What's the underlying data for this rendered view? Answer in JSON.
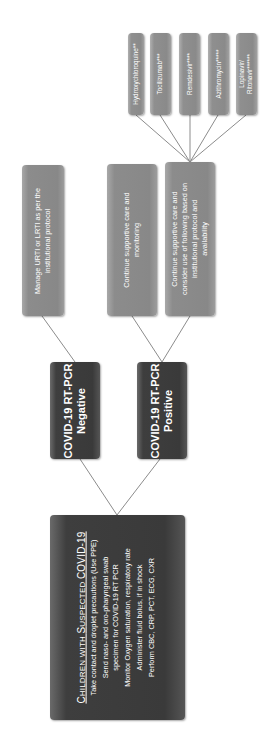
{
  "diagram": {
    "orientation": "rotated -90deg (reads bottom-to-top)",
    "root": {
      "title_prefix_C": "C",
      "title_small_1": "HILDREN WITH ",
      "title_prefix_S": "S",
      "title_small_2": "USPECTED ",
      "title_suffix": "COVID-19",
      "lines": [
        "Take contact and droplet precautions (Use PPE)",
        "Send naso-  and oro-pharyngeal swab",
        "specimen for COVID-19 RT PCR",
        "Monitor Oxygen saturation, respiratory rate",
        "Administer fluid bolus, if in shock",
        "Perform CBC, CRP, PCT, ECG, CXR"
      ]
    },
    "negative": {
      "line1": "COVID-19 RT-PCR",
      "line2": "Negative"
    },
    "positive": {
      "line1": "COVID-19 RT-PCR",
      "line2": "Positive"
    },
    "negative_action": {
      "line1": "Manage URTI or LRTI as per the",
      "line2": "institutional protocol"
    },
    "positive_action_1": {
      "line1": "Continue supportive care and",
      "line2": "monitoring"
    },
    "positive_action_2": {
      "line1": "Continue supportive care and",
      "line2": "consider use of following based on",
      "line3": "institutional protocol and",
      "line4": "availability"
    },
    "drugs": [
      {
        "line1": "Hydroxychloroquine**",
        "line2": ""
      },
      {
        "line1": "Tocilizumab***",
        "line2": ""
      },
      {
        "line1": "Remdesivir****",
        "line2": ""
      },
      {
        "line1": "Azithromycin*****",
        "line2": ""
      },
      {
        "line1": "Lopinavir/",
        "line2": "Ritonavir******"
      }
    ],
    "colors": {
      "dark_box": "#3a3a3a",
      "mid_box": "#8a8a8a",
      "connector": "#8c8c8c",
      "text": "#ffffff"
    }
  }
}
